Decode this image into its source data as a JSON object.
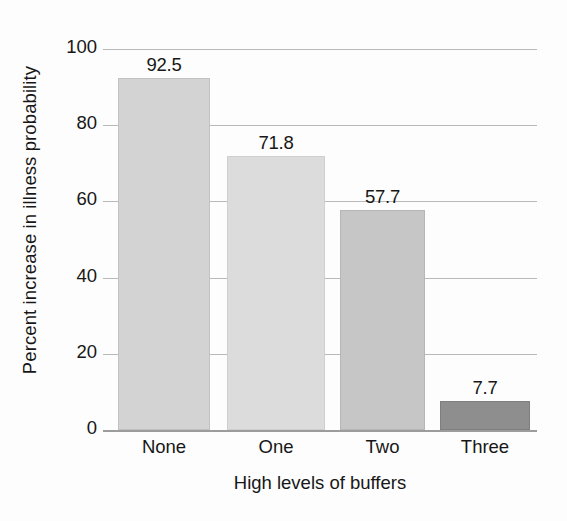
{
  "chart_data": {
    "type": "bar",
    "title": "",
    "xlabel": "High levels of buffers",
    "ylabel": "Percent increase in illness probability",
    "categories": [
      "None",
      "One",
      "Two",
      "Three"
    ],
    "values": [
      92.5,
      71.8,
      57.7,
      7.7
    ],
    "value_labels": [
      "92.5",
      "71.8",
      "57.7",
      "7.7"
    ],
    "bar_colors": [
      "#d3d3d3",
      "#dcdcdc",
      "#c6c6c6",
      "#8e8e8e"
    ],
    "bar_border_colors": [
      "#c2c2c2",
      "#cfcfcf",
      "#b6b6b6",
      "#7e7e7e"
    ],
    "ylim": [
      0,
      100
    ],
    "yticks": [
      100,
      80,
      60,
      40,
      20,
      0
    ],
    "ytick_labels": [
      "100",
      "80",
      "60",
      "40",
      "20",
      "0"
    ],
    "grid": true,
    "grid_color": "#b9b9b9",
    "axis_color": "#9c9c9c",
    "legend": null,
    "legend_position": "none"
  }
}
